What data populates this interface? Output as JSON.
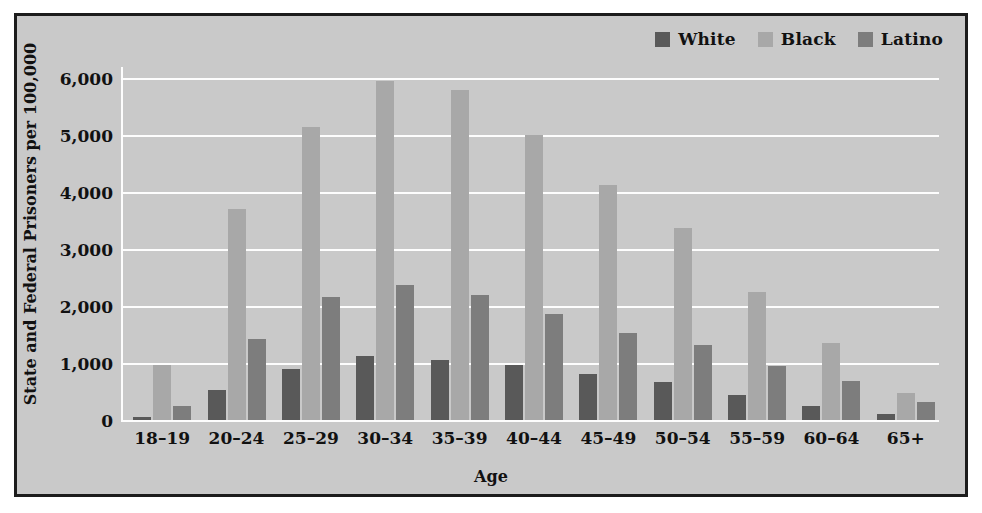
{
  "chart_data": {
    "type": "bar",
    "title": "",
    "xlabel": "Age",
    "ylabel": "State and Federal Prisoners per 100,000",
    "categories": [
      "18–19",
      "20–24",
      "25–29",
      "30–34",
      "35–39",
      "40–44",
      "45–49",
      "50–54",
      "55–59",
      "60–64",
      "65+"
    ],
    "series": [
      {
        "name": "White",
        "color": "#595959",
        "values": [
          60,
          520,
          900,
          1120,
          1060,
          960,
          810,
          660,
          440,
          250,
          110
        ]
      },
      {
        "name": "Black",
        "color": "#a8a8a8",
        "values": [
          960,
          3700,
          5150,
          5950,
          5800,
          5010,
          4120,
          3370,
          2240,
          1350,
          470
        ]
      },
      {
        "name": "Latino",
        "color": "#7d7d7d",
        "values": [
          250,
          1430,
          2160,
          2370,
          2200,
          1870,
          1530,
          1310,
          950,
          690,
          310
        ]
      }
    ],
    "yticks": [
      0,
      1000,
      2000,
      3000,
      4000,
      5000,
      6000
    ],
    "ytick_labels": [
      "0",
      "1,000",
      "2,000",
      "3,000",
      "4,000",
      "5,000",
      "6,000"
    ],
    "ylim": [
      0,
      6200
    ],
    "grid": true,
    "legend_position": "top-right",
    "plot_background": "#c9c9c9",
    "gridline_color": "#fdfdfd",
    "border_color": "#1c1c1c"
  }
}
